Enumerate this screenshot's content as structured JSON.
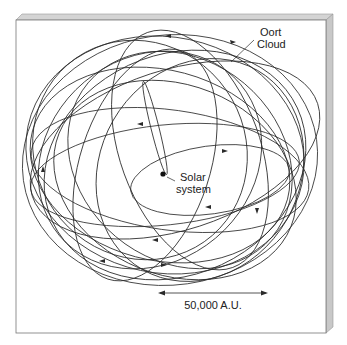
{
  "diagram": {
    "labels": {
      "oort_line1": "Oort",
      "oort_line2": "Cloud",
      "solar_line1": "Solar",
      "solar_line2": "system",
      "scale": "50,000 A.U."
    },
    "colors": {
      "line": "#2a2a2a",
      "face": "#ffffff",
      "bevel_top": "#d4d4d4",
      "bevel_side": "#c8c8c8",
      "border": "#777777"
    }
  }
}
